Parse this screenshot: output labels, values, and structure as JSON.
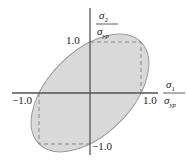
{
  "diagram": {
    "type": "yield-criteria-plot",
    "axes": {
      "x": {
        "numerator": "σ",
        "numerator_sub": "1",
        "denominator": "σ",
        "denominator_sub": "yp"
      },
      "y": {
        "numerator": "σ",
        "numerator_sub": "2",
        "denominator": "σ",
        "denominator_sub": "yp"
      }
    },
    "ticks": {
      "x_pos": "1.0",
      "x_neg": "−1.0",
      "y_pos": "1.0",
      "y_neg": "−1.0"
    },
    "shapes": {
      "ellipse": {
        "label": "von Mises ellipse",
        "fill": "#d9d9d9",
        "stroke": "#9a9a9a"
      },
      "square": {
        "label": "Tresca hexagon (dashed)",
        "stroke": "#8a8a8a"
      }
    },
    "colors": {
      "axis": "#555555",
      "background": "#ffffff"
    }
  }
}
